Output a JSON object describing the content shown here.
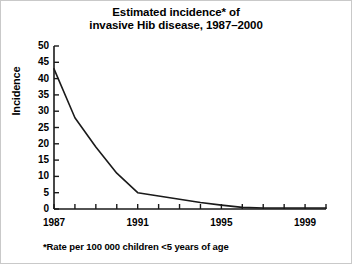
{
  "figure": {
    "title_lines": [
      "Estimated incidence* of",
      "invasive Hib disease, 1987–2000"
    ],
    "footnote": "*Rate per 100 000 children <5 years of age",
    "line_color": "#1a1a1a",
    "axis_color": "#1a1a1a",
    "background": "#ffffff"
  },
  "chart_data": {
    "type": "line",
    "title": "Estimated incidence* of invasive Hib disease, 1987–2000",
    "xlabel": "",
    "ylabel": "Incidence",
    "footnote": "*Rate per 100 000 children <5 years of age",
    "x": [
      1987,
      1988,
      1989,
      1990,
      1991,
      1992,
      1993,
      1994,
      1995,
      1996,
      1997,
      1998,
      1999,
      2000
    ],
    "values": [
      43,
      28,
      19,
      11,
      5,
      4,
      3,
      2,
      1.2,
      0.5,
      0.3,
      0.3,
      0.3,
      0.3
    ],
    "series": [
      {
        "name": "Invasive Hib disease incidence",
        "values": [
          43,
          28,
          19,
          11,
          5,
          4,
          3,
          2,
          1.2,
          0.5,
          0.3,
          0.3,
          0.3,
          0.3
        ]
      }
    ],
    "xlim": [
      1987,
      2000
    ],
    "ylim": [
      0,
      50
    ],
    "ytick_values": [
      0,
      5,
      10,
      15,
      20,
      25,
      30,
      35,
      40,
      45,
      50
    ],
    "ytick_labels": [
      "0",
      "5",
      "10",
      "15",
      "20",
      "25",
      "30",
      "35",
      "40",
      "45",
      "50"
    ],
    "xtick_values": [
      1987,
      1988,
      1989,
      1990,
      1991,
      1992,
      1993,
      1994,
      1995,
      1996,
      1997,
      1998,
      1999,
      2000
    ],
    "xtick_labels_shown": [
      {
        "value": 1987,
        "label": "1987"
      },
      {
        "value": 1991,
        "label": "1991"
      },
      {
        "value": 1995,
        "label": "1995"
      },
      {
        "value": 1999,
        "label": "1999"
      }
    ],
    "grid": false,
    "legend": false,
    "legend_position": "none",
    "markers": false
  }
}
